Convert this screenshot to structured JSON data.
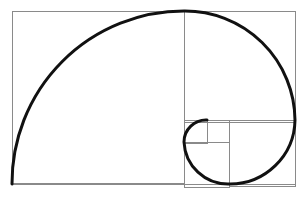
{
  "diagram": {
    "colors": {
      "background": "#ffffff",
      "grid": "#8a8a8a",
      "spiral": "#111111"
    },
    "outer_rect": {
      "x": 12,
      "y": 11,
      "w": 283,
      "h": 173
    },
    "squares": [
      {
        "x": 12,
        "y": 11,
        "size": 172
      },
      {
        "x": 184,
        "y": 11,
        "size": 111
      },
      {
        "x": 229,
        "y": 120,
        "size": 66
      },
      {
        "x": 184,
        "y": 142,
        "size": 45
      },
      {
        "x": 184,
        "y": 120,
        "size": 23
      },
      {
        "x": 207,
        "y": 120,
        "size": 22
      }
    ],
    "spiral_arcs": [
      {
        "from": [
          12,
          184
        ],
        "to": [
          184,
          11
        ],
        "r": 172
      },
      {
        "from": [
          184,
          11
        ],
        "to": [
          295,
          120
        ],
        "r": 110
      },
      {
        "from": [
          295,
          120
        ],
        "to": [
          229,
          184
        ],
        "r": 65
      },
      {
        "from": [
          229,
          184
        ],
        "to": [
          184,
          142
        ],
        "r": 44
      },
      {
        "from": [
          184,
          142
        ],
        "to": [
          207,
          120
        ],
        "r": 22
      }
    ]
  }
}
